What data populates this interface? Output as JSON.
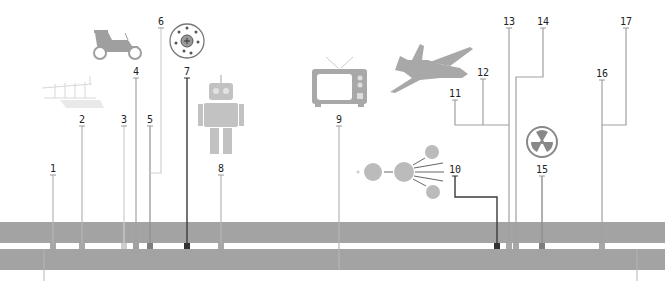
{
  "diagram": {
    "type": "timeline",
    "colors": {
      "band": "#a3a3a3",
      "line_light": "#b5b5b5",
      "line_mid": "#8f8f8f",
      "line_dark": "#3a3a3a",
      "icon": "#b0b0b0"
    },
    "bands": [
      {
        "top": 222,
        "height": 21
      },
      {
        "top": 249,
        "height": 21
      }
    ],
    "events": [
      {
        "label": "1",
        "x": 53,
        "label_y": 163,
        "icon": "none"
      },
      {
        "label": "2",
        "x": 82,
        "label_y": 114,
        "icon": "wright-flyer-airplane-icon"
      },
      {
        "label": "3",
        "x": 124,
        "label_y": 114,
        "icon": "none"
      },
      {
        "label": "4",
        "x": 136,
        "label_y": 66,
        "icon": "vintage-car-icon"
      },
      {
        "label": "5",
        "x": 150,
        "label_y": 114,
        "icon": "none"
      },
      {
        "label": "6",
        "x": 161,
        "label_y": 16,
        "icon": "none"
      },
      {
        "label": "7",
        "x": 187,
        "label_y": 66,
        "icon": "atom-nucleus-icon"
      },
      {
        "label": "8",
        "x": 221,
        "label_y": 163,
        "icon": "robot-icon"
      },
      {
        "label": "9",
        "x": 339,
        "label_y": 114,
        "icon": "television-icon"
      },
      {
        "label": "10",
        "x": 455,
        "label_y": 164,
        "icon": "nuclear-fission-icon"
      },
      {
        "label": "11",
        "x": 455,
        "label_y": 88,
        "icon": "jet-airplane-icon"
      },
      {
        "label": "12",
        "x": 483,
        "label_y": 67,
        "icon": "none"
      },
      {
        "label": "13",
        "x": 509,
        "label_y": 16,
        "icon": "none"
      },
      {
        "label": "14",
        "x": 543,
        "label_y": 16,
        "icon": "none"
      },
      {
        "label": "15",
        "x": 542,
        "label_y": 164,
        "icon": "radiation-icon"
      },
      {
        "label": "16",
        "x": 602,
        "label_y": 68,
        "icon": "none"
      },
      {
        "label": "17",
        "x": 626,
        "label_y": 16,
        "icon": "none"
      }
    ]
  }
}
